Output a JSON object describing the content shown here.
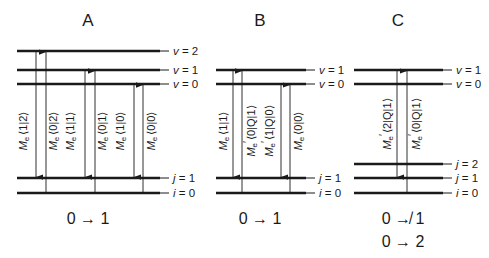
{
  "panels": [
    {
      "id": "A",
      "title": "A",
      "upper_levels": [
        {
          "symbol": "v",
          "value": "2",
          "y": 51
        },
        {
          "symbol": "v",
          "value": "1",
          "y": 70
        },
        {
          "symbol": "v",
          "value": "0",
          "y": 84
        }
      ],
      "lower_levels": [
        {
          "symbol": "j",
          "value": "1",
          "y": 178
        },
        {
          "symbol": "i",
          "value": "0",
          "y": 193
        }
      ],
      "matrix_elements": [
        {
          "label": "M",
          "sub": "e",
          "prime": "",
          "bra_ket": "⟨1|2⟩"
        },
        {
          "label": "M",
          "sub": "e",
          "prime": "",
          "bra_ket": "⟨0|2⟩"
        },
        {
          "label": "M",
          "sub": "e",
          "prime": "",
          "bra_ket": "⟨1|1⟩"
        },
        {
          "label": "M",
          "sub": "e",
          "prime": "",
          "bra_ket": "⟨0|1⟩"
        },
        {
          "label": "M",
          "sub": "e",
          "prime": "",
          "bra_ket": "⟨1|0⟩"
        },
        {
          "label": "M",
          "sub": "e",
          "prime": "",
          "bra_ket": "⟨0|0⟩"
        }
      ],
      "transitions": [
        "0 → 1"
      ]
    },
    {
      "id": "B",
      "title": "B",
      "upper_levels": [
        {
          "symbol": "v",
          "value": "1",
          "y": 70
        },
        {
          "symbol": "v",
          "value": "0",
          "y": 84
        }
      ],
      "lower_levels": [
        {
          "symbol": "j",
          "value": "1",
          "y": 178
        },
        {
          "symbol": "i",
          "value": "0",
          "y": 193
        }
      ],
      "matrix_elements": [
        {
          "label": "M",
          "sub": "e",
          "prime": "",
          "bra_ket": "⟨1|1⟩"
        },
        {
          "label": "M",
          "sub": "e",
          "prime": "′",
          "bra_ket": "⟨0|Q|1⟩"
        },
        {
          "label": "M",
          "sub": "e",
          "prime": "′",
          "bra_ket": "⟨1|Q|0⟩"
        },
        {
          "label": "M",
          "sub": "e",
          "prime": "",
          "bra_ket": "⟨0|0⟩"
        }
      ],
      "transitions": [
        "0 → 1"
      ]
    },
    {
      "id": "C",
      "title": "C",
      "upper_levels": [
        {
          "symbol": "v",
          "value": "1",
          "y": 70
        },
        {
          "symbol": "v",
          "value": "0",
          "y": 84
        }
      ],
      "lower_levels": [
        {
          "symbol": "j",
          "value": "2",
          "y": 164
        },
        {
          "symbol": "j",
          "value": "1",
          "y": 178
        },
        {
          "symbol": "i",
          "value": "0",
          "y": 193
        }
      ],
      "matrix_elements": [
        {
          "label": "M",
          "sub": "e",
          "prime": "′",
          "bra_ket": "⟨2|Q|1⟩"
        },
        {
          "label": "M",
          "sub": "e",
          "prime": "′",
          "bra_ket": "⟨0|Q|1⟩"
        }
      ],
      "transitions": [
        "0 ↛ 1",
        "0 → 2"
      ]
    }
  ],
  "level_eq": " = ",
  "colors": {
    "ink": "#1a1a1a",
    "background": "#ffffff"
  }
}
